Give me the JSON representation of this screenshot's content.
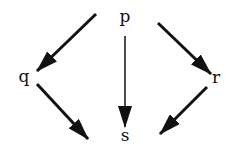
{
  "diagram": {
    "type": "directed-graph",
    "nodes": [
      {
        "id": "p",
        "label": "p",
        "x": 125,
        "y": 17
      },
      {
        "id": "q",
        "label": "q",
        "x": 24,
        "y": 77
      },
      {
        "id": "r",
        "label": "r",
        "x": 215,
        "y": 78
      },
      {
        "id": "s",
        "label": "s",
        "x": 125,
        "y": 134
      }
    ],
    "edges": [
      {
        "from": "p",
        "to": "q"
      },
      {
        "from": "p",
        "to": "s"
      },
      {
        "from": "p",
        "to": "r"
      },
      {
        "from": "q",
        "to": "s"
      },
      {
        "from": "r",
        "to": "s"
      }
    ]
  }
}
